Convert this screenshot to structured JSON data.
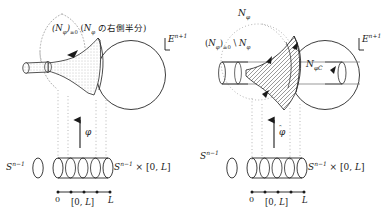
{
  "figure": {
    "colors": {
      "stroke": "#1a1a1a",
      "dotted_gray": "#9a9a9a",
      "hatch": "#4d4d4d",
      "stipple": "#8c8c8c",
      "text": "#1a1a1a"
    }
  },
  "left_panel": {
    "top_label": {
      "prefix": "(",
      "N_symbol": "N",
      "phi_sub": "φ",
      "close_paren": ")",
      "ge_zero": "≥0",
      "space_open": " (",
      "N_symbol2": "N",
      "phi_sub2": "φ",
      "japanese": "の右側半分",
      "close": ")",
      "full_text": "(Nφ)≥0 (Nφ の右側半分)"
    },
    "ambient_label": {
      "symbol": "E",
      "exponent": "n+1",
      "full_text": "E^{n+1}"
    },
    "sphere_label": {
      "symbol": "S",
      "exponent": "n−1",
      "full_text": "S^{n−1}"
    },
    "cylinder_label": {
      "symbol": "S",
      "exponent": "n−1",
      "times": " × ",
      "interval": "[0, L]",
      "full_text": "S^{n−1} × [0, L]"
    },
    "map_arrow_label": "φ",
    "interval_axis": {
      "left_tick_label": "0",
      "right_tick_label": "L",
      "center_label": "[0, L]",
      "dot_count": 5
    }
  },
  "right_panel": {
    "top_label": {
      "N_symbol": "N",
      "phi_sub": "φ",
      "full_text": "Nφ"
    },
    "set_label": {
      "prefix": "(",
      "N_symbol": "N",
      "phi_sub": "φ",
      "close_paren": ")",
      "ge_zero": "≥0",
      "setminus": " \\ ",
      "N_symbol2": "N",
      "phi_sub2": "φ",
      "full_text": "(Nφ)≥0 \\ Nφ"
    },
    "collar_label": {
      "N_symbol": "N",
      "sub": "φC",
      "full_text": "NφC"
    },
    "ambient_label": {
      "symbol": "E",
      "exponent": "n+1",
      "full_text": "E^{n+1}"
    },
    "sphere_label": {
      "symbol": "S",
      "exponent": "n−1",
      "full_text": "S^{n−1}"
    },
    "cylinder_label": {
      "symbol": "S",
      "exponent": "n−1",
      "times": " × ",
      "interval": "[0, L]",
      "full_text": "S^{n−1} × [0, L]"
    },
    "map_arrow_label": {
      "base": "φ",
      "accent": "̂",
      "full_text": "φ̂"
    },
    "interval_axis": {
      "left_tick_label": "0",
      "right_tick_label": "L",
      "center_label": "[0, L]",
      "dot_count": 5
    }
  }
}
